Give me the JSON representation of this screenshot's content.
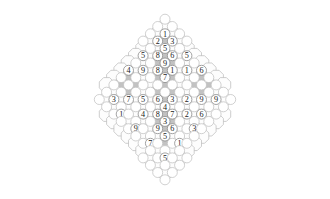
{
  "figure": {
    "type": "lattice-grid",
    "shape": "rhombus",
    "background_color": "#ffffff",
    "cell_fill_white": "#fdfdfd",
    "cell_fill_gray": "#c2c2c2",
    "cell_stroke": "#b9b9b9",
    "node_fill": "#ffffff",
    "node_stroke": "#8c8c8c",
    "label_color": "#1b1b1b",
    "canvas": {
      "width": 330,
      "height": 199
    },
    "geometry": {
      "center_x": 165,
      "center_y": 99.5,
      "step_x": 14.6,
      "step_y": 14.6,
      "half_step_x": 7.3,
      "half_step_y": 7.3,
      "node_radius": 5.0,
      "octagon_radius": 7.3,
      "rows": 25,
      "max_columns": 21
    },
    "value_range": {
      "min": 1,
      "max": 9
    },
    "distinct_values": [
      1,
      2,
      3,
      4,
      5,
      6,
      7,
      8,
      9
    ]
  },
  "chart_data": {
    "type": "heatmap",
    "xlabel": "",
    "ylabel": "",
    "legend": [],
    "grid": true,
    "axis_ranges": {
      "x": [
        -10,
        10
      ],
      "y": [
        -12,
        12
      ]
    },
    "note": "Diamond lattice of octagonal tiles; labelled circular nodes sit on lattice vertices. Coordinates are (col,row) on a diagonal lattice with origin at the diamond centre.",
    "labeled_nodes": [
      {
        "col": 0,
        "row": -12,
        "value": 1
      },
      {
        "col": -2,
        "row": -10,
        "value": 2
      },
      {
        "col": 2,
        "row": -10,
        "value": 9
      },
      {
        "col": 0,
        "row": -9,
        "value": 1
      },
      {
        "col": -4,
        "row": -8,
        "value": 4
      },
      {
        "col": -1,
        "row": -8,
        "value": 2
      },
      {
        "col": 1,
        "row": -8,
        "value": 3
      },
      {
        "col": 5,
        "row": -8,
        "value": 7
      },
      {
        "col": 0,
        "row": -7,
        "value": 5
      },
      {
        "col": -6,
        "row": -6,
        "value": 5
      },
      {
        "col": -3,
        "row": -6,
        "value": 5
      },
      {
        "col": -1,
        "row": -6,
        "value": 8
      },
      {
        "col": 1,
        "row": -6,
        "value": 6
      },
      {
        "col": 3,
        "row": -6,
        "value": 5
      },
      {
        "col": 6,
        "row": -6,
        "value": 6
      },
      {
        "col": 0,
        "row": -5,
        "value": 9
      },
      {
        "col": -7,
        "row": -4,
        "value": 8
      },
      {
        "col": -5,
        "row": -4,
        "value": 4
      },
      {
        "col": -3,
        "row": -4,
        "value": 9
      },
      {
        "col": -1,
        "row": -4,
        "value": 8
      },
      {
        "col": 1,
        "row": -4,
        "value": 1
      },
      {
        "col": 3,
        "row": -4,
        "value": 1
      },
      {
        "col": 5,
        "row": -4,
        "value": 6
      },
      {
        "col": 7,
        "row": -4,
        "value": 4
      },
      {
        "col": 0,
        "row": -3,
        "value": 7
      },
      {
        "col": -9,
        "row": -2,
        "value": 6
      },
      {
        "col": 9,
        "row": -2,
        "value": 8
      },
      {
        "col": -7,
        "row": 0,
        "value": 3
      },
      {
        "col": -5,
        "row": 0,
        "value": 7
      },
      {
        "col": -3,
        "row": 0,
        "value": 5
      },
      {
        "col": -1,
        "row": 0,
        "value": 6
      },
      {
        "col": 1,
        "row": 0,
        "value": 3
      },
      {
        "col": 3,
        "row": 0,
        "value": 2
      },
      {
        "col": 5,
        "row": 0,
        "value": 9
      },
      {
        "col": 7,
        "row": 0,
        "value": 9
      },
      {
        "col": 0,
        "row": 1,
        "value": 4
      },
      {
        "col": -6,
        "row": 2,
        "value": 1
      },
      {
        "col": -3,
        "row": 2,
        "value": 4
      },
      {
        "col": -1,
        "row": 2,
        "value": 8
      },
      {
        "col": 1,
        "row": 2,
        "value": 7
      },
      {
        "col": 3,
        "row": 2,
        "value": 2
      },
      {
        "col": 5,
        "row": 2,
        "value": 6
      },
      {
        "col": 0,
        "row": 3,
        "value": 3
      },
      {
        "col": -4,
        "row": 4,
        "value": 9
      },
      {
        "col": -1,
        "row": 4,
        "value": 9
      },
      {
        "col": 1,
        "row": 4,
        "value": 6
      },
      {
        "col": 4,
        "row": 4,
        "value": 3
      },
      {
        "col": 0,
        "row": 5,
        "value": 5
      },
      {
        "col": -2,
        "row": 6,
        "value": 7
      },
      {
        "col": 2,
        "row": 6,
        "value": 1
      },
      {
        "col": 0,
        "row": 8,
        "value": 5
      }
    ],
    "gray_tiles": [
      {
        "col": 0,
        "row": -8
      },
      {
        "col": 0,
        "row": -6
      },
      {
        "col": -1,
        "row": -5
      },
      {
        "col": 1,
        "row": -5
      },
      {
        "col": 0,
        "row": -4
      },
      {
        "col": -2,
        "row": -3
      },
      {
        "col": -1,
        "row": -3
      },
      {
        "col": 1,
        "row": -3
      },
      {
        "col": 2,
        "row": -3
      },
      {
        "col": -6,
        "row": -3
      },
      {
        "col": -5,
        "row": -3
      },
      {
        "col": -4,
        "row": -3
      },
      {
        "col": 4,
        "row": -3
      },
      {
        "col": 5,
        "row": -3
      },
      {
        "col": 6,
        "row": -3
      },
      {
        "col": 0,
        "row": -2
      },
      {
        "col": -6,
        "row": -2
      },
      {
        "col": -4,
        "row": -2
      },
      {
        "col": 4,
        "row": -2
      },
      {
        "col": 6,
        "row": -2
      },
      {
        "col": -2,
        "row": -1
      },
      {
        "col": -1,
        "row": -1
      },
      {
        "col": 1,
        "row": -1
      },
      {
        "col": 2,
        "row": -1
      },
      {
        "col": -6,
        "row": -1
      },
      {
        "col": -5,
        "row": -1
      },
      {
        "col": -4,
        "row": -1
      },
      {
        "col": 4,
        "row": -1
      },
      {
        "col": 5,
        "row": -1
      },
      {
        "col": 6,
        "row": -1
      },
      {
        "col": 0,
        "row": 0
      },
      {
        "col": 0,
        "row": 2
      },
      {
        "col": -1,
        "row": 3
      },
      {
        "col": 1,
        "row": 3
      },
      {
        "col": 0,
        "row": 4
      },
      {
        "col": 0,
        "row": 6
      }
    ]
  }
}
